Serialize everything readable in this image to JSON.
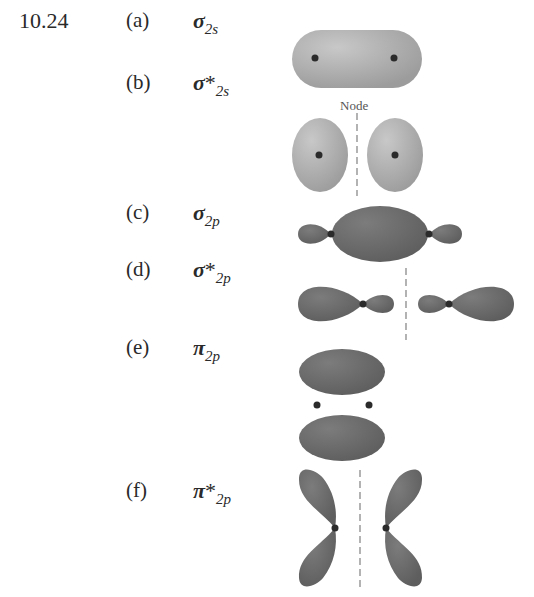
{
  "problem_number": "10.24",
  "node_label": "Node",
  "items": [
    {
      "label": "(a)",
      "symbol": "σ",
      "star": "",
      "subscript": "2s",
      "description": "bonding sigma 2s orbital"
    },
    {
      "label": "(b)",
      "symbol": "σ",
      "star": "*",
      "subscript": "2s",
      "description": "antibonding sigma 2s orbital with node"
    },
    {
      "label": "(c)",
      "symbol": "σ",
      "star": "",
      "subscript": "2p",
      "description": "bonding sigma 2p orbital"
    },
    {
      "label": "(d)",
      "symbol": "σ",
      "star": "*",
      "subscript": "2p",
      "description": "antibonding sigma 2p orbital with node"
    },
    {
      "label": "(e)",
      "symbol": "π",
      "star": "",
      "subscript": "2p",
      "description": "bonding pi 2p orbital"
    },
    {
      "label": "(f)",
      "symbol": "π",
      "star": "*",
      "subscript": "2p",
      "description": "antibonding pi 2p orbital with node"
    }
  ],
  "colors": {
    "s_orbital": "#a9a9a9",
    "p_orbital": "#6b6b6b",
    "nucleus": "#2b2b2b",
    "node_line": "#8a8a8a"
  }
}
